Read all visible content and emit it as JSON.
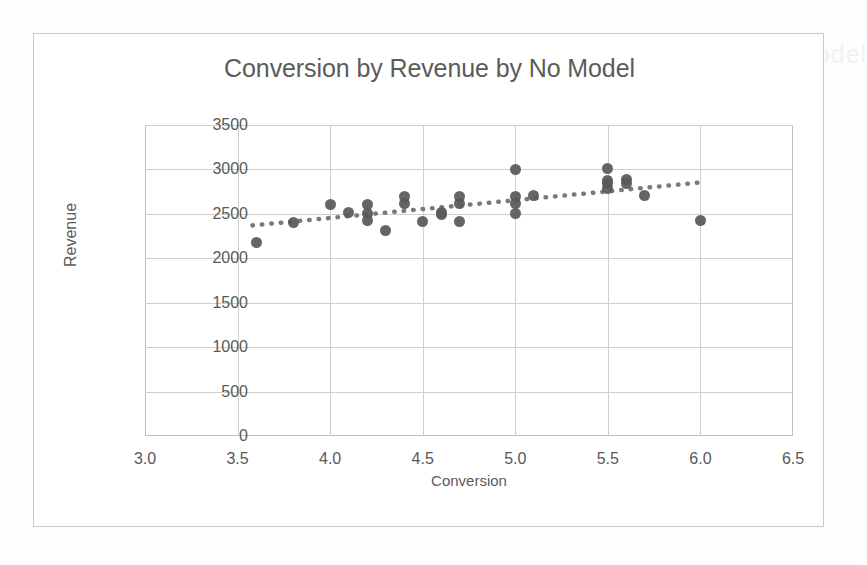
{
  "chart_data": {
    "type": "scatter",
    "title": "Conversion by Revenue by No Model",
    "xlabel": "Conversion",
    "ylabel": "Revenue",
    "xlim": [
      3.0,
      6.5
    ],
    "ylim": [
      0,
      3500
    ],
    "xticks": [
      "3.0",
      "3.5",
      "4.0",
      "4.5",
      "5.0",
      "5.5",
      "6.0",
      "6.5"
    ],
    "xtick_values": [
      3.0,
      3.5,
      4.0,
      4.5,
      5.0,
      5.5,
      6.0,
      6.5
    ],
    "yticks": [
      "0",
      "500",
      "1000",
      "1500",
      "2000",
      "2500",
      "3000",
      "3500"
    ],
    "ytick_values": [
      0,
      500,
      1000,
      1500,
      2000,
      2500,
      3000,
      3500
    ],
    "grid": "both",
    "legend": "none",
    "marker_color": "#595959",
    "trendline_color": "#7a7a7a",
    "trendline_style": "dotted",
    "series": [
      {
        "name": "Conversion vs Revenue",
        "x": [
          3.6,
          3.8,
          4.0,
          4.1,
          4.2,
          4.2,
          4.2,
          4.3,
          4.4,
          4.4,
          4.5,
          4.6,
          4.6,
          4.7,
          4.7,
          4.7,
          5.0,
          5.0,
          5.0,
          5.0,
          5.1,
          5.5,
          5.5,
          5.5,
          5.5,
          5.6,
          5.6,
          5.7,
          6.0
        ],
        "y": [
          2180,
          2400,
          2600,
          2510,
          2600,
          2500,
          2420,
          2310,
          2700,
          2620,
          2410,
          2520,
          2490,
          2700,
          2620,
          2410,
          3000,
          2700,
          2620,
          2500,
          2710,
          3010,
          2880,
          2840,
          2790,
          2890,
          2840,
          2710,
          2420
        ]
      }
    ],
    "trendline": {
      "x_start": 3.58,
      "y_start": 2370,
      "x_end": 6.01,
      "y_end": 2855
    }
  },
  "ghost_text": {
    "top": "Conversion by Revenue by No Model",
    "bottom": "Conversion by Revenue by No Model"
  }
}
